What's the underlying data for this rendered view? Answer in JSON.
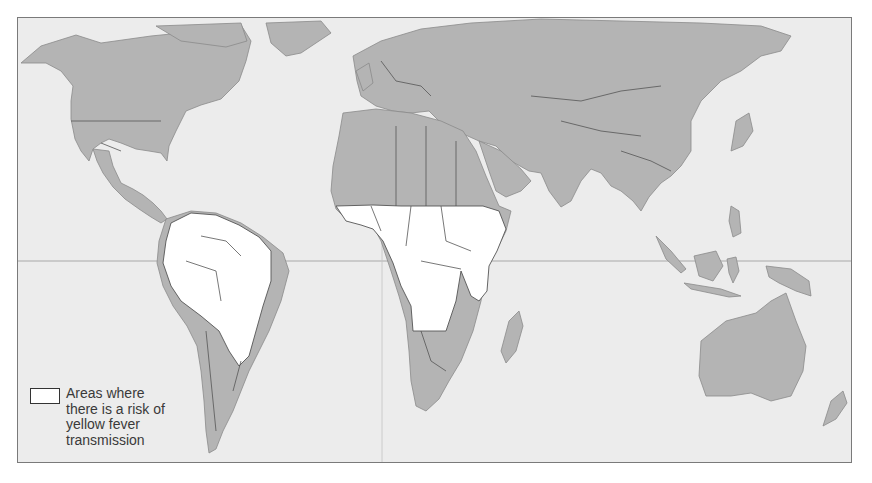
{
  "map": {
    "title": "World map: yellow fever transmission risk",
    "colors": {
      "ocean": "#ececec",
      "land": "#b4b4b4",
      "risk_area": "#ffffff",
      "border": "#555555",
      "frame": "#7a7a7a"
    },
    "risk_regions": [
      "Central and South America (tropical)",
      "Sub-Saharan Africa (tropical belt)"
    ],
    "equator_line": true
  },
  "legend": {
    "swatch_color": "#ffffff",
    "label": "Areas where there is a risk of yellow fever transmission"
  }
}
